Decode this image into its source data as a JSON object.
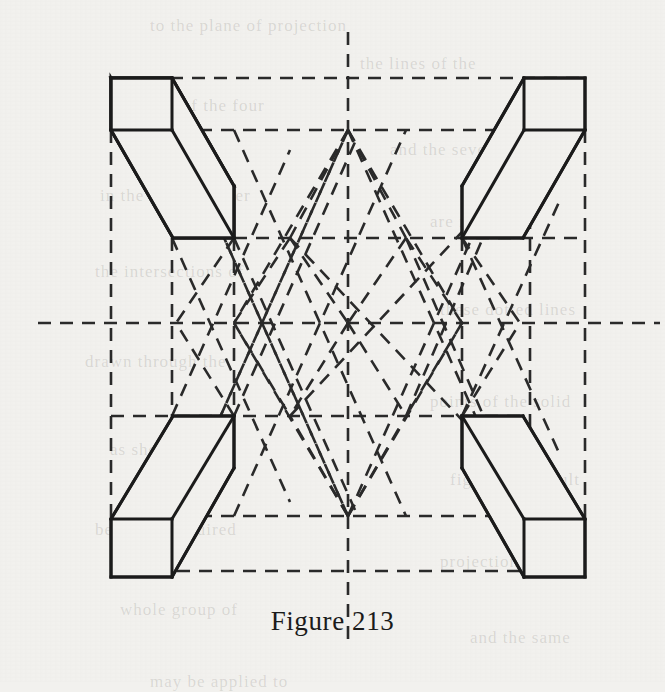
{
  "page": {
    "background_color": "#f2f1ee",
    "ink_color": "#1b1b1b",
    "width": 665,
    "height": 682
  },
  "caption": {
    "text": "Figure 213",
    "label": "Figure",
    "number": "213"
  },
  "figure": {
    "title": "Figure 213",
    "solid_line_color": "#1b1b1b",
    "dashed_line_color": "#2a2a2a",
    "solid_stroke_width": 3,
    "dashed_stroke_width": 2.6,
    "dash_pattern": "13 9",
    "frame": {
      "left": 111,
      "right": 585,
      "top": 78,
      "bottom": 577,
      "center_x": 348,
      "center_y": 323
    },
    "axes": {
      "vertical_center_x": 348,
      "vertical_top": 32,
      "vertical_bottom": 648,
      "horizontal_center_y": 323,
      "horizontal_left": 38,
      "horizontal_right": 660
    },
    "guide_rows": [
      78,
      130,
      238,
      323,
      416,
      516,
      571
    ],
    "guide_cols": [
      111,
      172,
      234,
      348,
      462,
      530,
      585
    ],
    "apex_points": [
      {
        "name": "top-apex",
        "x": 348,
        "y": 130
      },
      {
        "name": "bottom-apex",
        "x": 348,
        "y": 516
      }
    ],
    "boxes": [
      {
        "name": "box-top-left",
        "position": "top-left",
        "face": {
          "x": 111,
          "y": 78,
          "w": 61,
          "h": 52
        },
        "depth_dx": 62,
        "depth_dy": 108
      },
      {
        "name": "box-top-right",
        "position": "top-right",
        "face": {
          "x": 524,
          "y": 78,
          "w": 61,
          "h": 52
        },
        "depth_dx": -62,
        "depth_dy": 108
      },
      {
        "name": "box-bottom-left",
        "position": "bottom-left",
        "face": {
          "x": 111,
          "y": 519,
          "w": 61,
          "h": 58
        },
        "depth_dx": 62,
        "depth_dy": -103
      },
      {
        "name": "box-bottom-right",
        "position": "bottom-right",
        "face": {
          "x": 524,
          "y": 519,
          "w": 61,
          "h": 58
        },
        "depth_dx": -62,
        "depth_dy": -103
      }
    ]
  },
  "background_page_text": {
    "note": "faint bleed-through text from the reverse of the printed page",
    "lines": [
      {
        "text": "to the plane of projection",
        "x": 150,
        "y": 16
      },
      {
        "text": "the lines of the",
        "x": 360,
        "y": 54
      },
      {
        "text": "of each of the four",
        "x": 120,
        "y": 96
      },
      {
        "text": "and the several",
        "x": 390,
        "y": 140
      },
      {
        "text": "in the same manner",
        "x": 100,
        "y": 186
      },
      {
        "text": "are found by",
        "x": 430,
        "y": 212
      },
      {
        "text": "the intersections of",
        "x": 95,
        "y": 262
      },
      {
        "text": "these dotted lines",
        "x": 440,
        "y": 300
      },
      {
        "text": "drawn through the",
        "x": 85,
        "y": 352
      },
      {
        "text": "points of the solid",
        "x": 430,
        "y": 392
      },
      {
        "text": "as shown in the",
        "x": 110,
        "y": 440
      },
      {
        "text": "figure, the result",
        "x": 450,
        "y": 470
      },
      {
        "text": "being the required",
        "x": 95,
        "y": 520
      },
      {
        "text": "projection of the",
        "x": 440,
        "y": 552
      },
      {
        "text": "whole group of",
        "x": 120,
        "y": 600
      },
      {
        "text": "and the same",
        "x": 470,
        "y": 628
      },
      {
        "text": "may be applied to",
        "x": 150,
        "y": 672
      }
    ]
  }
}
